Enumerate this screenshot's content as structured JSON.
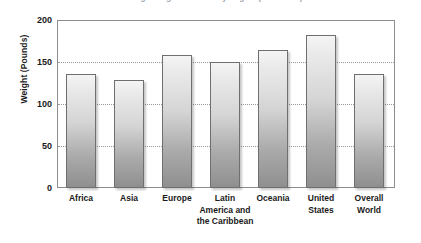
{
  "chart_data": {
    "type": "bar",
    "title": "Average Weight of Adults by Region (in Pounds)",
    "xlabel": "",
    "ylabel": "Weight (Pounds)",
    "categories": [
      "Africa",
      "Asia",
      "Europe",
      "Latin America and the Caribbean",
      "Oceania",
      "United States",
      "Overall World"
    ],
    "values": [
      136,
      129,
      158,
      150,
      164,
      182,
      136
    ],
    "ylim": [
      0,
      200
    ],
    "yticks": [
      0,
      50,
      100,
      150,
      200
    ],
    "ytick_labels": [
      "0",
      "50",
      "100",
      "150",
      "200"
    ],
    "grid": true,
    "gridlines_at": [
      50,
      100,
      150
    ],
    "legend": "none",
    "bar_count": 7
  },
  "axis": {
    "y_title": "Weight (Pounds)",
    "y_labels": [
      "200",
      "150",
      "100",
      "50",
      "0"
    ]
  },
  "categories_wrapped": [
    "Africa",
    "Asia",
    "Europe",
    "Latin\nAmerica and\nthe Caribbean",
    "Oceania",
    "United\nStates",
    "Overall\nWorld"
  ],
  "colors": {
    "bar_top": "#f4f4f4",
    "bar_bottom": "#8f8f8f",
    "bar_border": "#6f6f6f",
    "frame": "#8d8d8d",
    "grid": "#9a9a9a",
    "text": "#1a1a1a"
  }
}
